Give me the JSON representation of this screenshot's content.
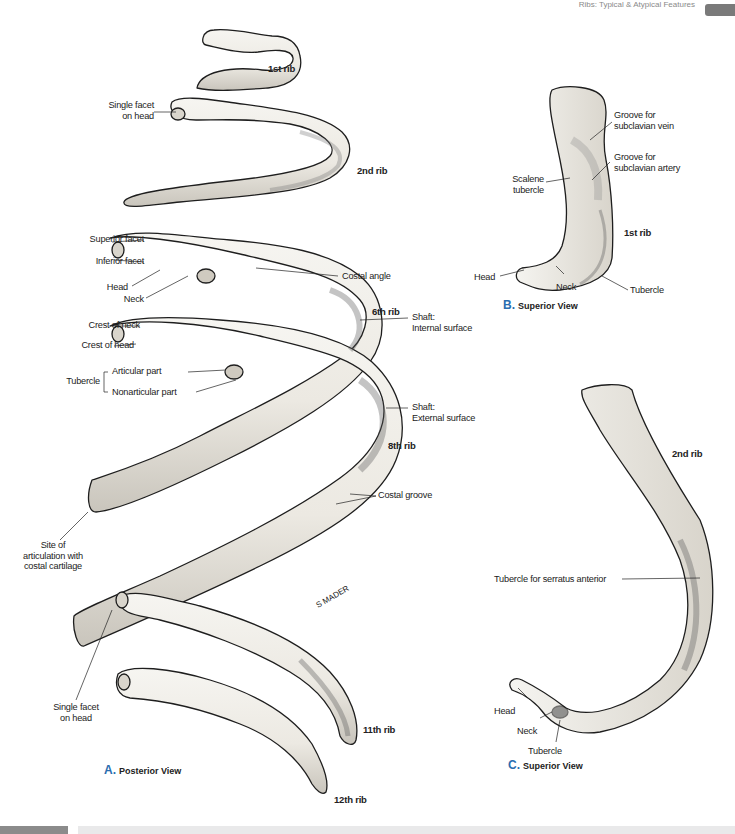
{
  "header": {
    "running_head": "Ribs: Typical & Atypical Features",
    "tab_color": "#7a7a7a"
  },
  "views": {
    "A": {
      "letter": "A.",
      "label": "Posterior View"
    },
    "B": {
      "letter": "B.",
      "label": "Superior View"
    },
    "C": {
      "letter": "C.",
      "label": "Superior View"
    }
  },
  "panel_a": {
    "rib_labels": {
      "rib1": "1st rib",
      "rib2": "2nd rib",
      "rib6": "6th rib",
      "rib8": "8th rib",
      "rib11": "11th rib",
      "rib12": "12th rib"
    },
    "left_labels": {
      "single_facet_head_top": [
        "Single facet",
        "on head"
      ],
      "superior_facet": "Superior facet",
      "inferior_facet": "Inferior facet",
      "head": "Head",
      "neck": "Neck",
      "crest_of_neck": "Crest of neck",
      "crest_of_head": "Crest of head",
      "tubercle": "Tubercle",
      "articular_part": "Articular part",
      "nonarticular_part": "Nonarticular part",
      "site_of_articulation": [
        "Site of",
        "articulation with",
        "costal cartilage"
      ],
      "single_facet_head_bottom": [
        "Single facet",
        "on head"
      ]
    },
    "right_labels": {
      "costal_angle": "Costal angle",
      "shaft_internal": [
        "Shaft:",
        "Internal surface"
      ],
      "shaft_external": [
        "Shaft:",
        "External surface"
      ],
      "costal_groove": "Costal groove"
    },
    "signature": "S MADER"
  },
  "panel_b": {
    "labels": {
      "groove_vein": [
        "Groove for",
        "subclavian vein"
      ],
      "groove_artery": [
        "Groove for",
        "subclavian artery"
      ],
      "scalene_tubercle": [
        "Scalene",
        "tubercle"
      ],
      "rib": "1st rib",
      "head": "Head",
      "neck": "Neck",
      "tubercle": "Tubercle"
    }
  },
  "panel_c": {
    "labels": {
      "rib": "2nd rib",
      "serratus": "Tubercle for serratus anterior",
      "head": "Head",
      "neck": "Neck",
      "tubercle": "Tubercle"
    }
  },
  "colors": {
    "bone_fill": "#f1efe9",
    "bone_shade": "#b9b5ad",
    "outline": "#1e1e1e",
    "accent_blue": "#2a6db0",
    "footer_gray": "#e9e9ea"
  }
}
